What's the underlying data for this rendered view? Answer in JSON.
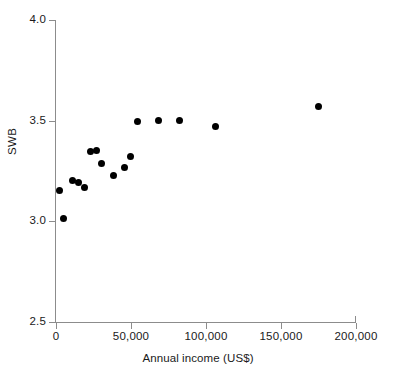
{
  "chart_data": {
    "type": "scatter",
    "title": "",
    "xlabel": "Annual income (US$)",
    "ylabel": "SWB",
    "xlim": [
      0,
      200000
    ],
    "ylim": [
      2.5,
      4.0
    ],
    "grid": false,
    "legend": null,
    "x_tick_labels": [
      "0",
      "50,000",
      "100,000",
      "150,000",
      "200,000"
    ],
    "x_tick_values": [
      0,
      50000,
      100000,
      150000,
      200000
    ],
    "y_tick_labels": [
      "2.5",
      "3.0",
      "3.5",
      "4.0"
    ],
    "y_tick_values": [
      2.5,
      3.0,
      3.5,
      4.0
    ],
    "marker_color": "#000000",
    "axis_color": "#8c8c8c",
    "points": [
      {
        "x": 2000,
        "y": 3.155
      },
      {
        "x": 5000,
        "y": 3.015
      },
      {
        "x": 11000,
        "y": 3.205
      },
      {
        "x": 15000,
        "y": 3.195
      },
      {
        "x": 19000,
        "y": 3.17
      },
      {
        "x": 23000,
        "y": 3.345
      },
      {
        "x": 27000,
        "y": 3.35
      },
      {
        "x": 30000,
        "y": 3.285
      },
      {
        "x": 38000,
        "y": 3.23
      },
      {
        "x": 45500,
        "y": 3.265
      },
      {
        "x": 49500,
        "y": 3.32
      },
      {
        "x": 54500,
        "y": 3.495
      },
      {
        "x": 68000,
        "y": 3.5
      },
      {
        "x": 82000,
        "y": 3.5
      },
      {
        "x": 106000,
        "y": 3.47
      },
      {
        "x": 175000,
        "y": 3.57
      }
    ]
  }
}
